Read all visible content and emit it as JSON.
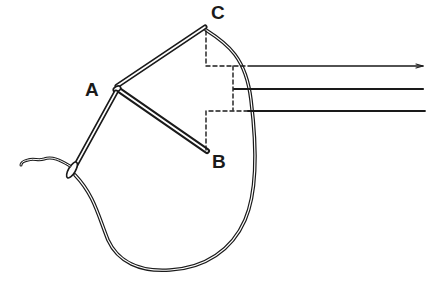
{
  "diagram": {
    "labels": {
      "A": "A",
      "B": "B",
      "C": "C"
    },
    "ink_color": "#1a1a1a",
    "background": "#ffffff"
  }
}
